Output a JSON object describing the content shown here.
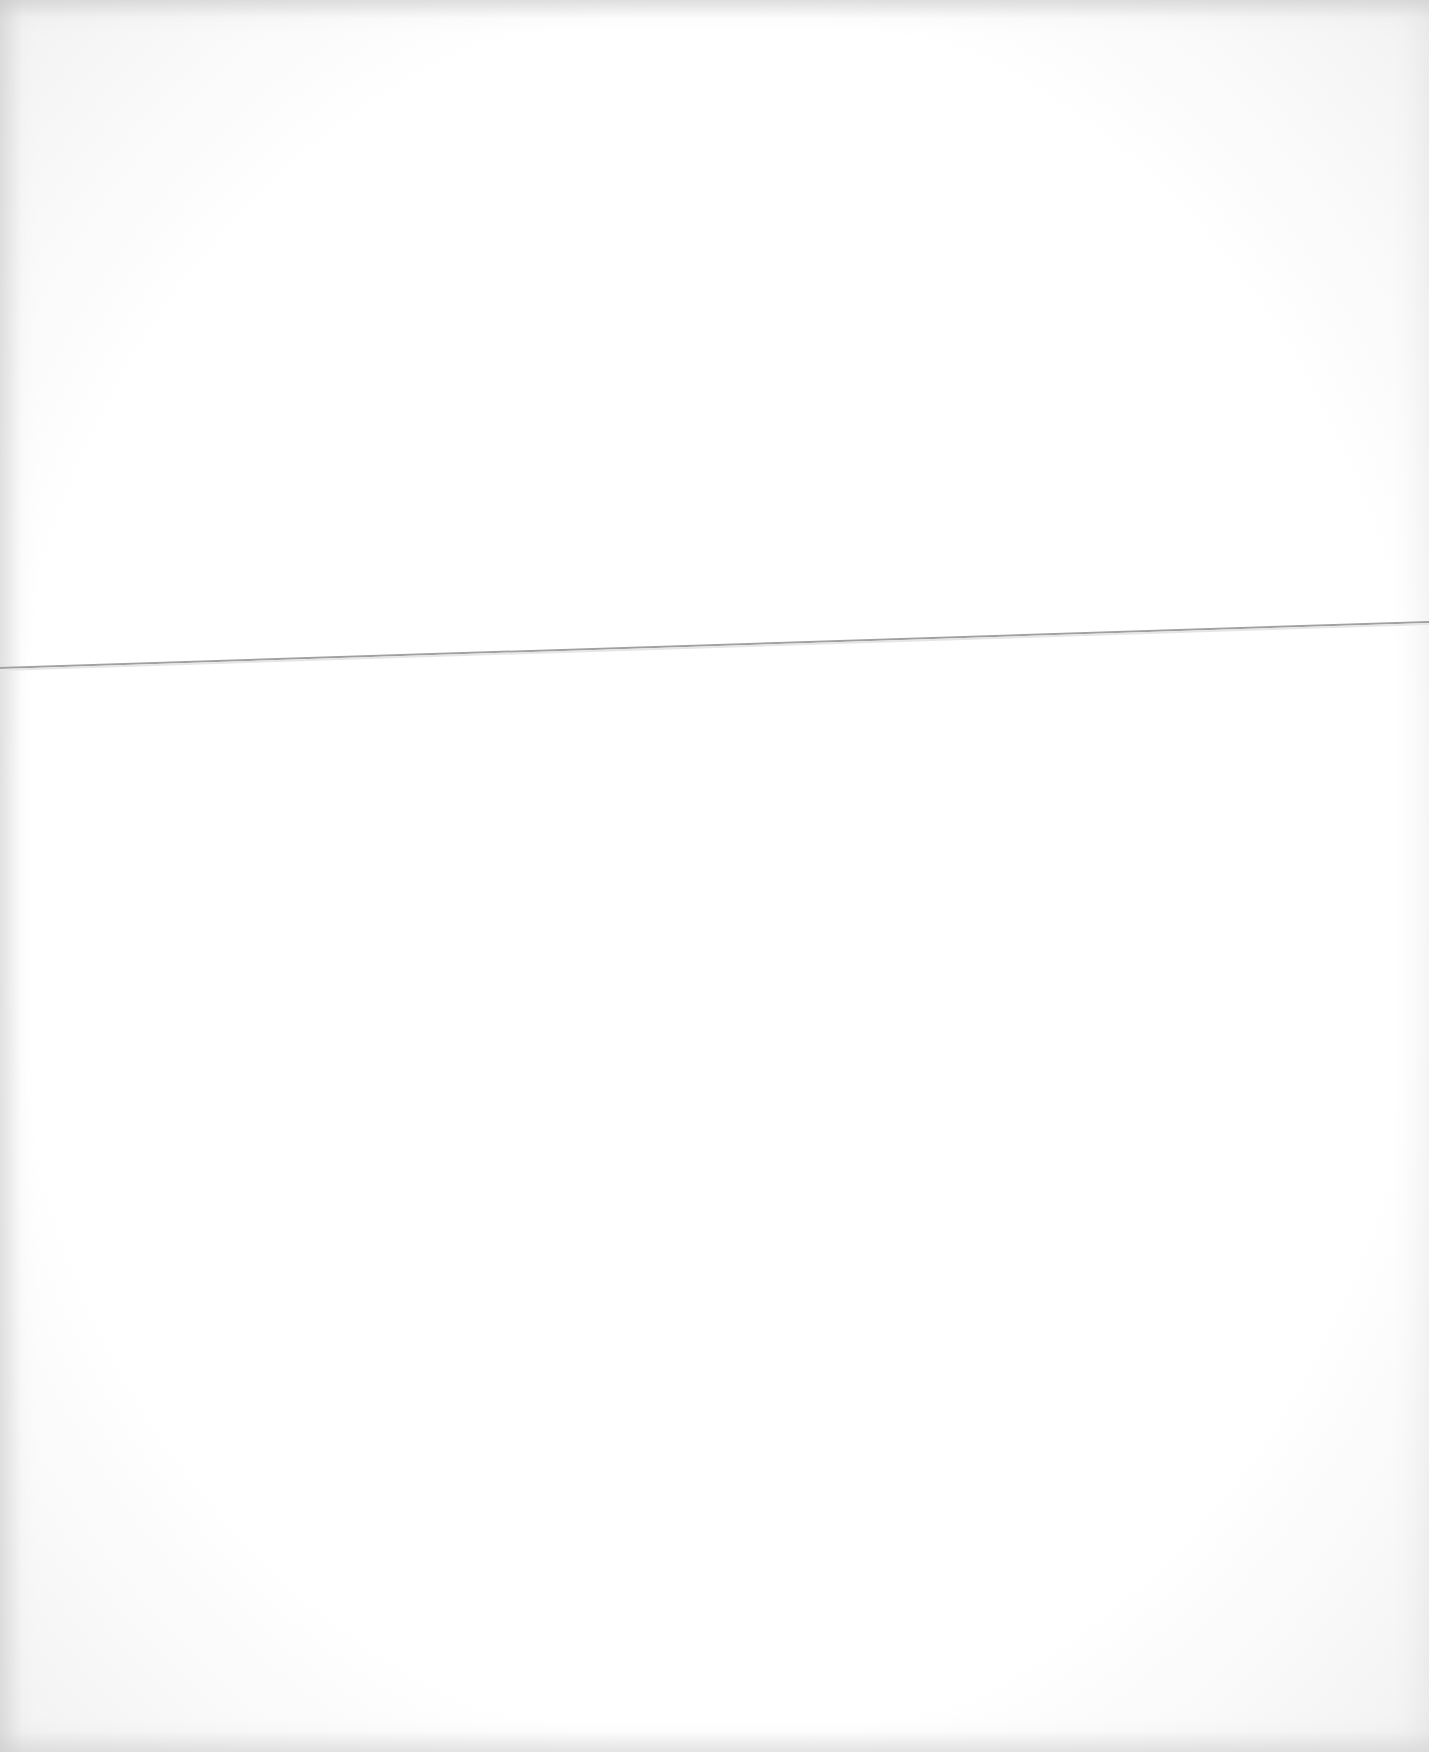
{
  "document": {
    "type": "scanned blank page",
    "text_blocks": [],
    "fold_line": {
      "x1": 0,
      "y1": 668,
      "x2": 1429,
      "y2": 622,
      "color": "#9a9a9a"
    },
    "paper_color": "#ffffff"
  }
}
